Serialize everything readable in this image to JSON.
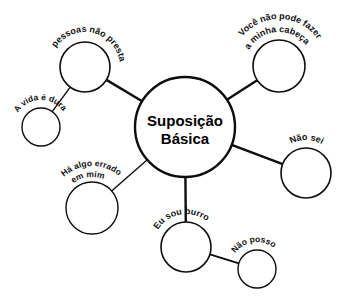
{
  "diagram": {
    "type": "mind-map",
    "language": "pt-BR",
    "background_color": "#ffffff",
    "stroke_color": "#0d0d0d",
    "text_color": "#111111",
    "center": {
      "id": "suposicao-basica",
      "label_line1": "Suposição",
      "label_line2": "Básica",
      "cx": 185,
      "cy": 127,
      "r": 50,
      "stroke_width": 2.4
    },
    "nodes": [
      {
        "id": "as-pessoas-nao-prestam",
        "label_line1": "As pessoas não prestam",
        "label_line2": "",
        "cx": 85,
        "cy": 67,
        "r": 25,
        "stroke_width": 1.6,
        "label_font_size": 9,
        "label_arc_r": 35,
        "label_arc_start_deg": 205,
        "label_arc_sweep_deg": 145,
        "connects_to": "suposicao-basica",
        "connector_width": 2.4
      },
      {
        "id": "a-vida-e-dura",
        "label_line1": "A vida é dura",
        "label_line2": "",
        "cx": 41,
        "cy": 127,
        "r": 19,
        "stroke_width": 1.4,
        "label_font_size": 8.5,
        "label_arc_r": 27,
        "label_arc_start_deg": 208,
        "label_arc_sweep_deg": 120,
        "connects_to": "as-pessoas-nao-prestam",
        "connector_width": 1.4
      },
      {
        "id": "voce-nao-pode-fazer-a-minha-cabeca",
        "label_line1": "Você não pode fazer",
        "label_line2": "a minha cabeça",
        "cx": 279,
        "cy": 66,
        "r": 26,
        "stroke_width": 1.6,
        "label_font_size": 9,
        "label_arc_r": 47,
        "label_arc_start_deg": 208,
        "label_arc_sweep_deg": 128,
        "label_arc_r2": 34,
        "label_arc_start_deg2": 204,
        "label_arc_sweep_deg2": 122,
        "connects_to": "suposicao-basica",
        "connector_width": 2.4
      },
      {
        "id": "nao-sei",
        "label_line1": "Não sei",
        "label_line2": "",
        "cx": 306,
        "cy": 173,
        "r": 25,
        "stroke_width": 1.6,
        "label_font_size": 9,
        "label_arc_r": 33,
        "label_arc_start_deg": 232,
        "label_arc_sweep_deg": 78,
        "connects_to": "suposicao-basica",
        "connector_width": 2.4
      },
      {
        "id": "ha-algo-errado-em-mim",
        "label_line1": "Há algo errado",
        "label_line2": "em mim",
        "cx": 92,
        "cy": 208,
        "r": 26,
        "stroke_width": 1.4,
        "label_font_size": 8.5,
        "label_arc_r": 42,
        "label_arc_start_deg": 213,
        "label_arc_sweep_deg": 112,
        "label_arc_r2": 31,
        "label_arc_start_deg2": 215,
        "label_arc_sweep_deg2": 95,
        "connects_to": "suposicao-basica",
        "connector_width": 1.4
      },
      {
        "id": "eu-sou-burro",
        "label_line1": "Eu sou burro",
        "label_line2": "",
        "cx": 186,
        "cy": 247,
        "r": 25,
        "stroke_width": 1.6,
        "label_font_size": 9,
        "label_arc_r": 33,
        "label_arc_start_deg": 205,
        "label_arc_sweep_deg": 110,
        "connects_to": "suposicao-basica",
        "connector_width": 2.4
      },
      {
        "id": "nao-posso",
        "label_line1": "Não posso",
        "label_line2": "",
        "cx": 257,
        "cy": 269,
        "r": 19,
        "stroke_width": 1.4,
        "label_font_size": 8.5,
        "label_arc_r": 27,
        "label_arc_start_deg": 212,
        "label_arc_sweep_deg": 100,
        "connects_to": "eu-sou-burro",
        "connector_width": 1.8
      }
    ]
  }
}
